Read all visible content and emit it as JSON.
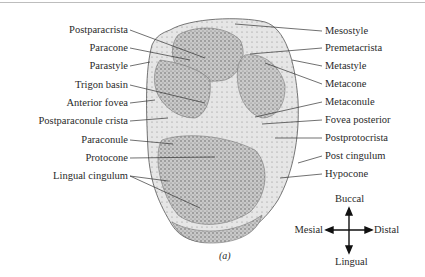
{
  "figure": {
    "caption": "(a)",
    "left_labels": [
      "Postparacrista",
      "Paracone",
      "Parastyle",
      "Trigon basin",
      "Anterior fovea",
      "Postparaconule crista",
      "Paraconule",
      "Protocone",
      "Lingual cingulum"
    ],
    "right_labels": [
      "Mesostyle",
      "Premetacrista",
      "Metastyle",
      "Metacone",
      "Metaconule",
      "Fovea posterior",
      "Postprotocrista",
      "Post cingulum",
      "Hypocone"
    ],
    "orientation": {
      "up": "Buccal",
      "down": "Lingual",
      "left": "Mesial",
      "right": "Distal"
    }
  }
}
